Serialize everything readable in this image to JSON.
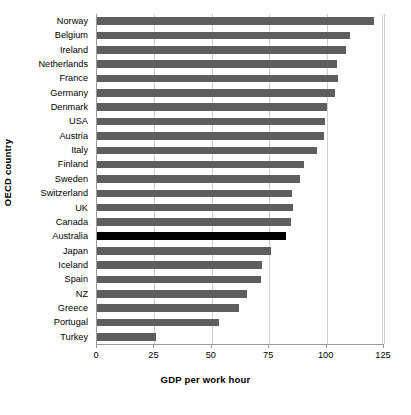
{
  "chart_data": {
    "type": "bar",
    "orientation": "horizontal",
    "title": "",
    "xlabel": "GDP per work hour",
    "ylabel": "OECD country",
    "xlim": [
      0,
      125
    ],
    "xticks": [
      0,
      25,
      50,
      75,
      100,
      125
    ],
    "xticklabels": [
      "0",
      "25",
      "50",
      "75",
      "100",
      "125"
    ],
    "grid": true,
    "grid_axis": "x",
    "legend": "none",
    "bar_color": "#5e5e5e",
    "highlight_color": "#000000",
    "highlight_category": "Australia",
    "categories": [
      "Norway",
      "Belgium",
      "Ireland",
      "Netherlands",
      "France",
      "Germany",
      "Denmark",
      "USA",
      "Austria",
      "Italy",
      "Finland",
      "Sweden",
      "Switzerland",
      "UK",
      "Canada",
      "Australia",
      "Japan",
      "Iceland",
      "Spain",
      "NZ",
      "Greece",
      "Portugal",
      "Turkey"
    ],
    "values": [
      120.5,
      110.0,
      108.5,
      104.5,
      105.0,
      103.5,
      100.0,
      99.5,
      99.0,
      96.0,
      90.0,
      88.5,
      85.0,
      85.5,
      84.5,
      82.5,
      76.0,
      72.0,
      71.5,
      65.5,
      62.0,
      53.0,
      25.5
    ],
    "highlighted": [
      false,
      false,
      false,
      false,
      false,
      false,
      false,
      false,
      false,
      false,
      false,
      false,
      false,
      false,
      false,
      true,
      false,
      false,
      false,
      false,
      false,
      false,
      false
    ]
  }
}
